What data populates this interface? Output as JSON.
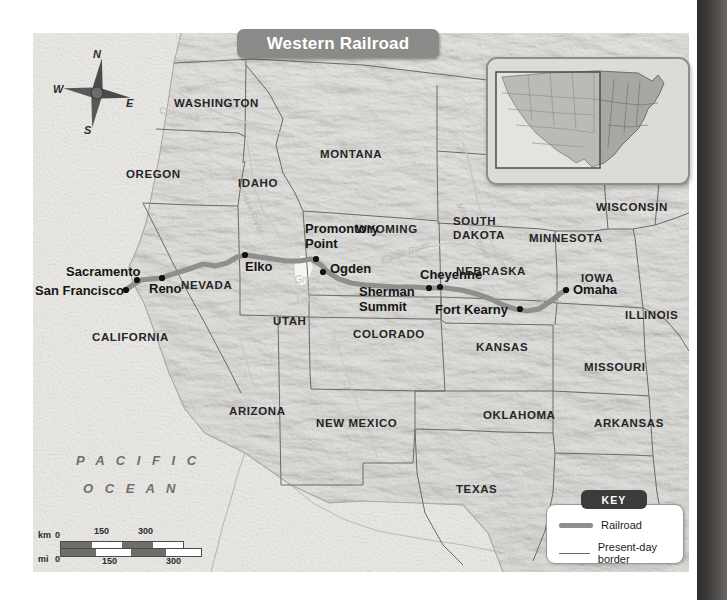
{
  "title": "Western Railroad",
  "ocean_label": "PACIFIC OCEAN",
  "colors": {
    "railroad": "#8f8f8d",
    "border": "#6a6a66",
    "land": "#c9c8c2",
    "ocean": "#e1e0dc",
    "banner": "#8a8a88",
    "key_tab": "#3b3b3b"
  },
  "compass": {
    "n": "N",
    "e": "E",
    "s": "S",
    "w": "W"
  },
  "states": [
    {
      "name": "WASHINGTON",
      "x": 172,
      "y": 69
    },
    {
      "name": "OREGON",
      "x": 123,
      "y": 140
    },
    {
      "name": "IDAHO",
      "x": 224,
      "y": 149
    },
    {
      "name": "MONTANA",
      "x": 310,
      "y": 120
    },
    {
      "name": "WYOMING",
      "x": 350,
      "y": 195
    },
    {
      "name": "NEVADA",
      "x": 172,
      "y": 251
    },
    {
      "name": "UTAH",
      "x": 260,
      "y": 287
    },
    {
      "name": "CALIFORNIA",
      "x": 92,
      "y": 303
    },
    {
      "name": "COLORADO",
      "x": 352,
      "y": 300
    },
    {
      "name": "ARIZONA",
      "x": 222,
      "y": 377
    },
    {
      "name": "NEW MEXICO",
      "x": 322,
      "y": 389
    },
    {
      "name": "TEXAS",
      "x": 444,
      "y": 455
    },
    {
      "name": "SOUTH DAKOTA",
      "x": 445,
      "y": 192
    },
    {
      "name": "NEBRASKA",
      "x": 452,
      "y": 237
    },
    {
      "name": "KANSAS",
      "x": 468,
      "y": 313
    },
    {
      "name": "OKLAHOMA",
      "x": 481,
      "y": 381
    },
    {
      "name": "MINNESOTA",
      "x": 530,
      "y": 204
    },
    {
      "name": "IOWA",
      "x": 562,
      "y": 244
    },
    {
      "name": "MISSOURI",
      "x": 575,
      "y": 333
    },
    {
      "name": "ARKANSAS",
      "x": 586,
      "y": 389
    },
    {
      "name": "WISCONSIN",
      "x": 594,
      "y": 173
    },
    {
      "name": "ILLINOIS",
      "x": 613,
      "y": 281
    }
  ],
  "cities": [
    {
      "name": "San Francisco",
      "x": 93,
      "y": 257,
      "dx": -86,
      "dy": -14
    },
    {
      "name": "Sacramento",
      "x": 104,
      "y": 246,
      "dx": -70,
      "dy": -20
    },
    {
      "name": "Reno",
      "x": 129,
      "y": 245,
      "dx": -12,
      "dy": 4
    },
    {
      "name": "Elko",
      "x": 212,
      "y": 222,
      "dx": 2,
      "dy": 6
    },
    {
      "name": "Promontory Point",
      "x": 283,
      "y": 226,
      "dx": 6,
      "dy": -38
    },
    {
      "name": "Ogden",
      "x": 290,
      "y": 239,
      "dx": 10,
      "dy": -9
    },
    {
      "name": "Sherman Summit",
      "x": 396,
      "y": 255,
      "dx": -68,
      "dy": 2
    },
    {
      "name": "Cheyenne",
      "x": 407,
      "y": 254,
      "dx": -16,
      "dy": -16
    },
    {
      "name": "Fort Kearny",
      "x": 487,
      "y": 276,
      "dx": -84,
      "dy": -3
    },
    {
      "name": "Omaha",
      "x": 533,
      "y": 257,
      "dx": 7,
      "dy": -6
    }
  ],
  "rivers": [
    {
      "name": "Columbia",
      "x": 152,
      "y": 80,
      "rot": -12
    },
    {
      "name": "Snake River",
      "x": 220,
      "y": 178,
      "rot": 62
    },
    {
      "name": "Platte River",
      "x": 383,
      "y": 208,
      "rot": 28
    },
    {
      "name": "Missouri River",
      "x": 452,
      "y": 181,
      "rot": 62
    }
  ],
  "lake": {
    "name": "Great Salt Lake",
    "lines": [
      "Great",
      "Salt",
      "Lake"
    ],
    "x": 270,
    "y": 250
  },
  "key": {
    "tab": "KEY",
    "items": [
      {
        "label": "Railroad",
        "type": "thick"
      },
      {
        "label": "Present-day border",
        "type": "thin"
      }
    ]
  },
  "scale": {
    "km_unit": "km",
    "mi_unit": "mi",
    "km_ticks": [
      "0",
      "150",
      "300"
    ],
    "mi_ticks": [
      "0",
      "150",
      "300"
    ]
  }
}
